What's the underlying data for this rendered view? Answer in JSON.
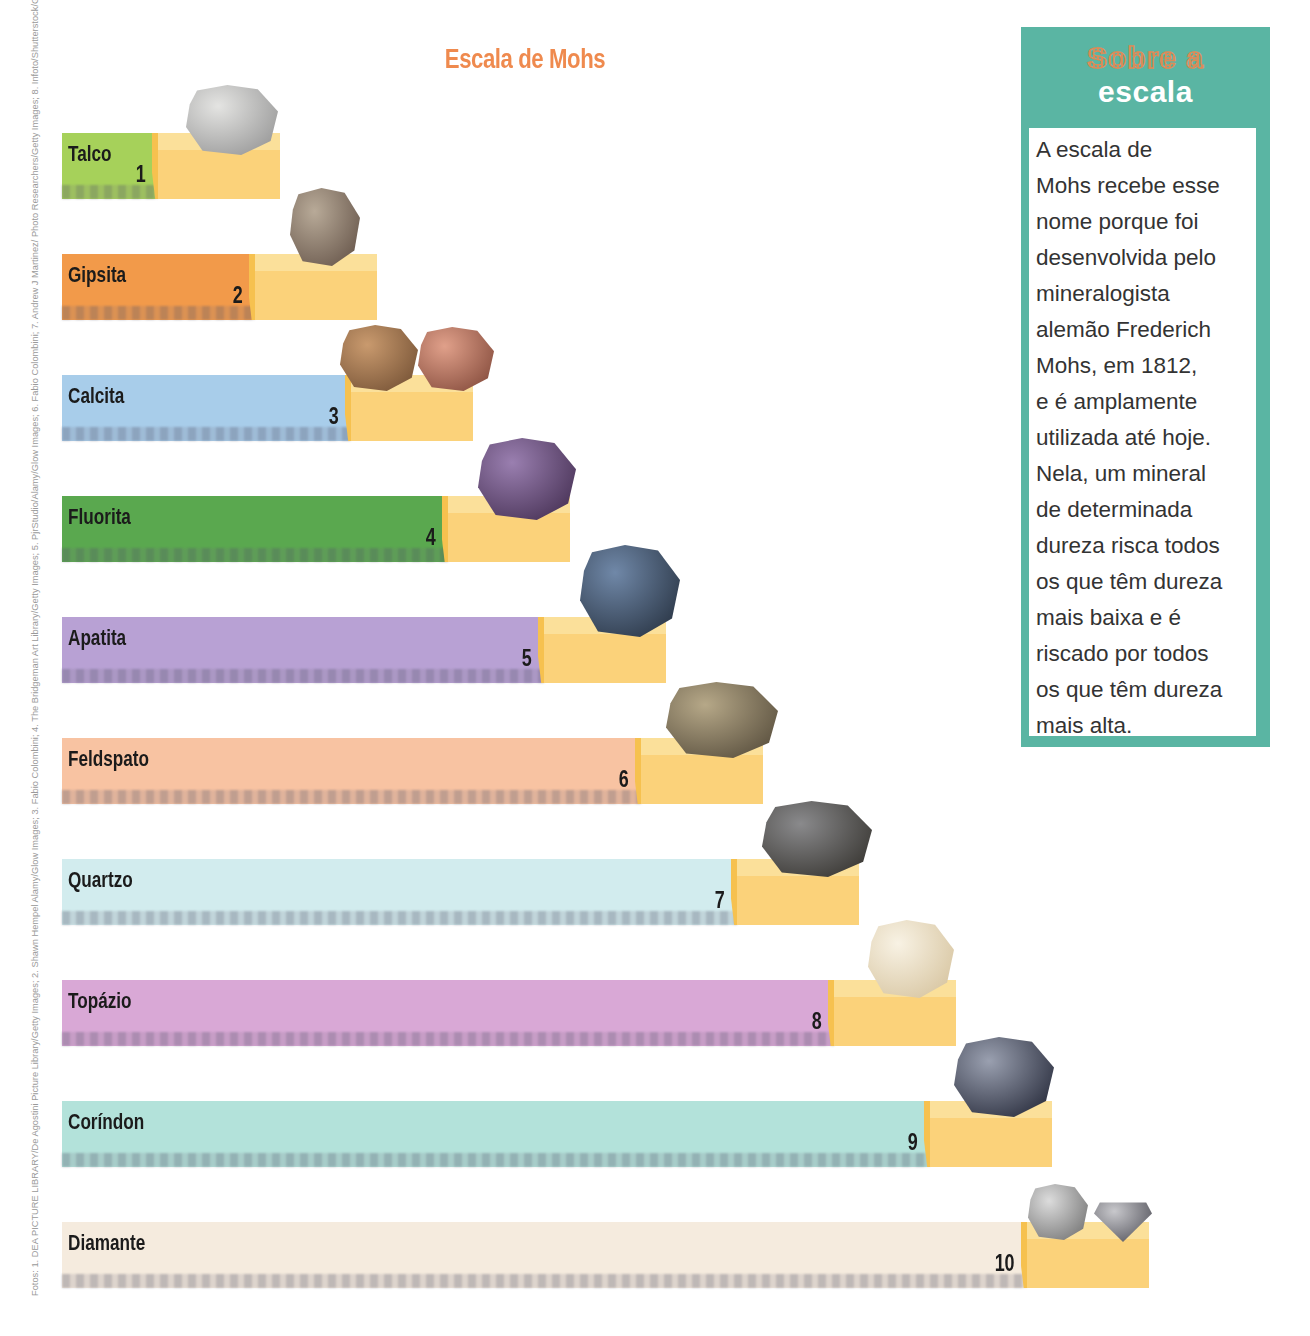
{
  "title": "Escala de Mohs",
  "photo_credits": "Fotos: 1. DEA PICTURE LIBRARY/De Agostini Picture Library/Getty Images; 2. Shawn Hempel Alamy/Glow Images; 3. Fabio Colombini; 4. The Bridgeman Art Library/Getty Images; 5. PjrStudio/Alamy/Glow Images; 6. Fabio Colombini; 7. Andrew J Martinez/ Photo Researchers/Getty Images; 8. Infoto/Shutterstock/Glow Images; 9. E R DEGGINGER/Photo Researchers/Getty Images; e 10. Dimitri Otis/Photographer's Choice/Getty Images",
  "sidebar": {
    "heading_line1": "Sobre a",
    "heading_line2": "escala",
    "text": "   A escala de\nMohs recebe esse\nnome porque foi\ndesenvolvida pelo\nmineralogista\nalemão Frederich\nMohs, em 1812,\ne é amplamente\nutilizada até hoje.\nNela, um mineral\nde determinada\ndureza risca todos\nos que têm dureza\nmais baixa e é\nriscado por todos\nos que têm dureza\nmais alta.",
    "color": "#5ab5a3"
  },
  "minerals": [
    {
      "name": "Talco",
      "hardness": "1",
      "color": "#a6d15a"
    },
    {
      "name": "Gipsita",
      "hardness": "2",
      "color": "#f29a4a"
    },
    {
      "name": "Calcita",
      "hardness": "3",
      "color": "#a8cdea"
    },
    {
      "name": "Fluorita",
      "hardness": "4",
      "color": "#5aa84f"
    },
    {
      "name": "Apatita",
      "hardness": "5",
      "color": "#b8a1d4"
    },
    {
      "name": "Feldspato",
      "hardness": "6",
      "color": "#f8c3a2"
    },
    {
      "name": "Quartzo",
      "hardness": "7",
      "color": "#d2ecee"
    },
    {
      "name": "Topázio",
      "hardness": "8",
      "color": "#d9a8d6"
    },
    {
      "name": "Coríndon",
      "hardness": "9",
      "color": "#b3e2da"
    },
    {
      "name": "Diamante",
      "hardness": "10",
      "color": "#f5ebde"
    }
  ],
  "chart_data": {
    "type": "bar",
    "title": "Escala de Mohs",
    "categories": [
      "Talco",
      "Gipsita",
      "Calcita",
      "Fluorita",
      "Apatita",
      "Feldspato",
      "Quartzo",
      "Topázio",
      "Coríndon",
      "Diamante"
    ],
    "values": [
      1,
      2,
      3,
      4,
      5,
      6,
      7,
      8,
      9,
      10
    ],
    "xlabel": "",
    "ylabel": "Dureza",
    "orientation": "horizontal",
    "ylim": [
      0,
      10
    ]
  }
}
